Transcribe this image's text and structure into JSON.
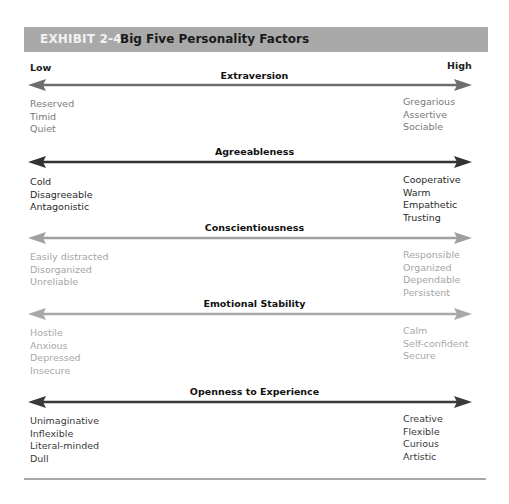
{
  "header": {
    "exhibit_label": "EXHIBIT 2-4",
    "title": "Big Five Personality Factors"
  },
  "scale": {
    "low_label": "Low",
    "high_label": "High"
  },
  "factors": [
    {
      "name": "Extraversion",
      "arrow_color": "#6e6e6e",
      "text_color": "#7a7a7a",
      "low_traits": [
        "Reserved",
        "Timid",
        "Quiet"
      ],
      "high_traits": [
        "Gregarious",
        "Assertive",
        "Sociable"
      ]
    },
    {
      "name": "Agreeableness",
      "arrow_color": "#333333",
      "text_color": "#2a2a2a",
      "low_traits": [
        "Cold",
        "Disagreeable",
        "Antagonistic"
      ],
      "high_traits": [
        "Cooperative",
        "Warm",
        "Empathetic",
        "Trusting"
      ]
    },
    {
      "name": "Conscientiousness",
      "arrow_color": "#a0a0a0",
      "text_color": "#a5a5a5",
      "low_traits": [
        "Easily distracted",
        "Disorganized",
        "Unreliable"
      ],
      "high_traits": [
        "Responsible",
        "Organized",
        "Dependable",
        "Persistent"
      ]
    },
    {
      "name": "Emotional Stability",
      "arrow_color": "#a8a8a8",
      "text_color": "#a8a8a8",
      "low_traits": [
        "Hostile",
        "Anxious",
        "Depressed",
        "Insecure"
      ],
      "high_traits": [
        "Calm",
        "Self-confident",
        "Secure"
      ]
    },
    {
      "name": "Openness to Experience",
      "arrow_color": "#3a3a3a",
      "text_color": "#3a3a3a",
      "low_traits": [
        "Unimaginative",
        "Inflexible",
        "Literal-minded",
        "Dull"
      ],
      "high_traits": [
        "Creative",
        "Flexible",
        "Curious",
        "Artistic"
      ]
    }
  ],
  "colors": {
    "header_bg": "#a9a9a9",
    "header_exhibit_text": "#f2f2f2",
    "rule": "#a8a8a8"
  }
}
